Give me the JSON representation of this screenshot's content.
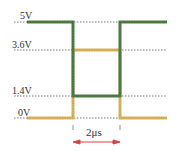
{
  "diagram": {
    "levels": [
      {
        "label": "5V",
        "value": 5,
        "y": 22
      },
      {
        "label": "3.6V",
        "value": 3.6,
        "y": 50
      },
      {
        "label": "1.4V",
        "value": 1.4,
        "y": 96
      },
      {
        "label": "0V",
        "value": 0,
        "y": 118
      }
    ],
    "interval_label": "2μs",
    "signals": [
      {
        "name": "green-signal",
        "color": "#4f7f45",
        "pattern": [
          "5V",
          "1.4V",
          "5V"
        ]
      },
      {
        "name": "yellow-signal",
        "color": "#d8b45a",
        "pattern": [
          "0V",
          "3.6V",
          "0V"
        ]
      }
    ],
    "colors": {
      "green": "#4f7f45",
      "yellow": "#d8b45a",
      "arrow": "#d94040",
      "dotted": "#777777"
    }
  }
}
